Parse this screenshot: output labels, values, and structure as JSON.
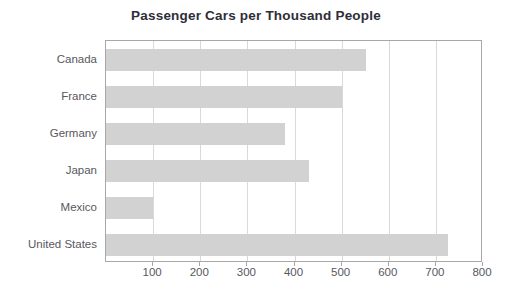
{
  "chart_data": {
    "type": "bar",
    "orientation": "horizontal",
    "title": "Passenger Cars per Thousand People",
    "xlabel": "",
    "ylabel": "",
    "categories": [
      "Canada",
      "France",
      "Germany",
      "Japan",
      "Mexico",
      "United States"
    ],
    "values": [
      552,
      500,
      380,
      430,
      100,
      725
    ],
    "xlim": [
      0,
      800
    ],
    "xticks": [
      100,
      200,
      300,
      400,
      500,
      600,
      700,
      800
    ],
    "xtick_labels": [
      "100",
      "200",
      "300",
      "400",
      "500",
      "600",
      "700",
      "800"
    ],
    "grid": true,
    "grid_axis": "x",
    "legend": false,
    "legend_position": "none",
    "series": [
      {
        "name": "Passenger cars per thousand people",
        "values": [
          552,
          500,
          380,
          430,
          100,
          725
        ]
      }
    ]
  },
  "style": {
    "bar_color": "#d2d2d2",
    "grid_color": "#d9d9d9",
    "axis_color": "#a8a8a8",
    "title_color": "#2e2e38",
    "label_color": "#58585e",
    "background": "#ffffff"
  }
}
